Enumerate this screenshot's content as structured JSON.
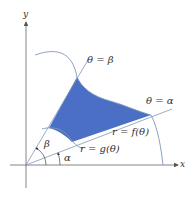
{
  "diagram": {
    "type": "polar-region",
    "colors": {
      "region_fill": "#4a6fc4",
      "curve": "#7f97b8",
      "axis": "#666666",
      "label": "#333333"
    },
    "axes": {
      "x_label": "x",
      "y_label": "y"
    },
    "rays": [
      {
        "id": "beta",
        "label": "θ = β"
      },
      {
        "id": "alpha",
        "label": "θ = α"
      }
    ],
    "curves": [
      {
        "id": "outer",
        "label": "r = f(θ)"
      },
      {
        "id": "inner",
        "label": "r = g(θ)"
      }
    ],
    "angles": [
      {
        "id": "beta",
        "label": "β"
      },
      {
        "id": "alpha",
        "label": "α"
      }
    ]
  }
}
